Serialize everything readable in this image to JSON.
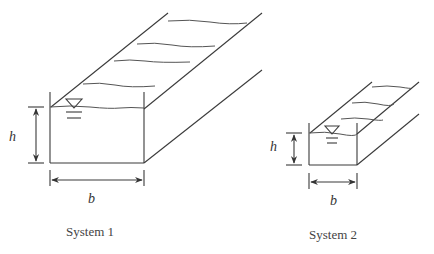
{
  "systems": [
    {
      "id": "system-1",
      "caption": "System 1",
      "height_label": "h",
      "width_label": "b"
    },
    {
      "id": "system-2",
      "caption": "System 2",
      "height_label": "h",
      "width_label": "b"
    }
  ],
  "icons": {
    "water_surface_symbol": "inverted-triangle-icon"
  },
  "colors": {
    "line": "#3a3a3a",
    "background": "#ffffff"
  }
}
